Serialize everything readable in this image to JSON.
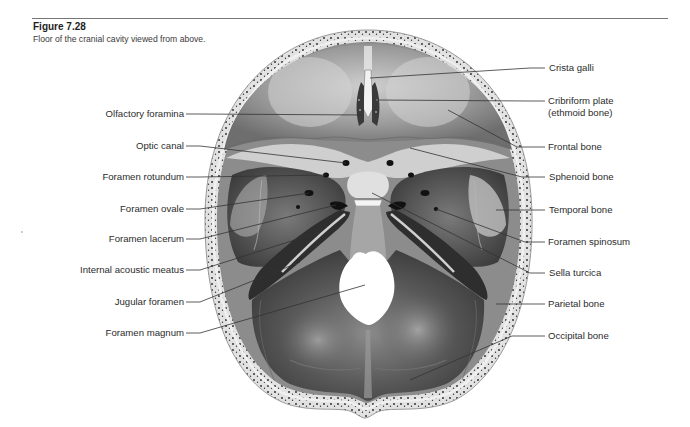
{
  "figure": {
    "number": "Figure 7.28",
    "caption": "Floor of the cranial cavity viewed from above."
  },
  "illustration": {
    "subject": "skull-cranial-floor",
    "palette": {
      "bone_light": "#d9d9d9",
      "bone_mid": "#9a9a9a",
      "bone_dark": "#3e3e3e",
      "rim": "#e4e4e4",
      "diploe_dots": "#222222",
      "leader_line": "#333333"
    }
  },
  "labels": {
    "left": [
      {
        "text": "Olfactory foramina"
      },
      {
        "text": "Optic canal"
      },
      {
        "text": "Foramen rotundum"
      },
      {
        "text": "Foramen ovale"
      },
      {
        "text": "Foramen lacerum"
      },
      {
        "text": "Internal acoustic meatus"
      },
      {
        "text": "Jugular foramen"
      },
      {
        "text": "Foramen magnum"
      }
    ],
    "right": [
      {
        "text": "Crista galli"
      },
      {
        "text": "Cribriform plate"
      },
      {
        "text": "(ethmoid bone)"
      },
      {
        "text": "Frontal bone"
      },
      {
        "text": "Sphenoid bone"
      },
      {
        "text": "Temporal bone"
      },
      {
        "text": "Foramen spinosum"
      },
      {
        "text": "Sella turcica"
      },
      {
        "text": "Parietal bone"
      },
      {
        "text": "Occipital bone"
      }
    ]
  }
}
